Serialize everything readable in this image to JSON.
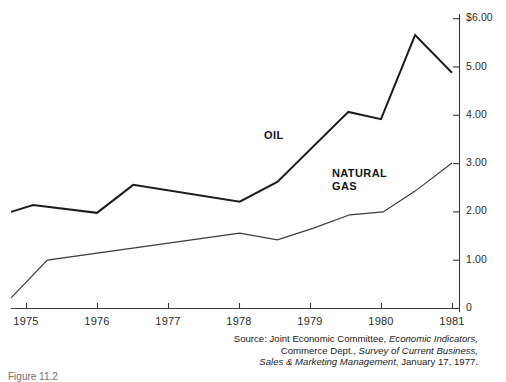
{
  "figure": {
    "caption": "Figure 11.2",
    "series_labels": {
      "oil": "OIL",
      "natural_gas": "NATURAL\nGAS"
    },
    "source": {
      "prefix": "Source: Joint Economic Committee, ",
      "italic1": "Economic Indicators,",
      "line2_prefix": "Commerce Dept., ",
      "italic2": "Survey of Current Business,",
      "italic3": "Sales & Marketing Management",
      "line3_suffix": ", January 17, 1977."
    }
  },
  "chart_data": {
    "type": "line",
    "title": "",
    "xlabel": "",
    "ylabel": "",
    "xlim": [
      1974.8,
      1981.0
    ],
    "ylim": [
      0,
      6.0
    ],
    "grid": false,
    "legend": "inline-annotations",
    "x_tick_labels": [
      "1975",
      "1976",
      "1977",
      "1978",
      "1979",
      "1980",
      "1981"
    ],
    "x_tick_values": [
      1975,
      1976,
      1977,
      1978,
      1979,
      1980,
      1981
    ],
    "y_tick_labels": [
      "$6.00",
      "5.00",
      "4.00",
      "3.00",
      "2.00",
      "1.00",
      "0"
    ],
    "y_tick_values": [
      6.0,
      5.0,
      4.0,
      3.0,
      2.0,
      1.0,
      0
    ],
    "y_axis_position": "right",
    "series": [
      {
        "name": "OIL",
        "color": "#1c1c1c",
        "x": [
          1974.79,
          1975.1,
          1976.0,
          1976.51,
          1978.01,
          1978.54,
          1979.54,
          1980.0,
          1980.48,
          1981.0
        ],
        "values": [
          1.99,
          2.13,
          1.97,
          2.55,
          2.2,
          2.61,
          4.06,
          3.91,
          5.65,
          4.87
        ]
      },
      {
        "name": "NATURAL GAS",
        "color": "#3b3b3b",
        "x": [
          1974.79,
          1975.3,
          1978.01,
          1978.54,
          1979.04,
          1979.56,
          1980.03,
          1980.48,
          1981.0
        ],
        "values": [
          0.21,
          0.99,
          1.55,
          1.41,
          1.65,
          1.93,
          1.99,
          2.42,
          3.0
        ]
      }
    ]
  }
}
